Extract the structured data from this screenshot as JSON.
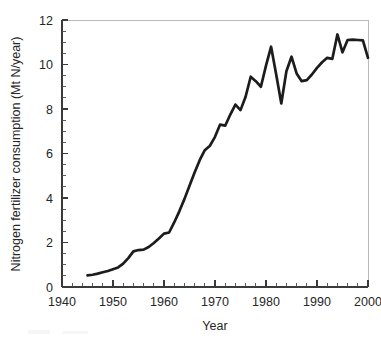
{
  "figure": {
    "background_color": "#ffffff",
    "line_color": "#1c1c1c",
    "axis_color": "#3a3a3a",
    "frame_color": "#b9b9b9"
  },
  "chart_data": {
    "type": "line",
    "title": "",
    "subtitle": "",
    "xlabel": "Year",
    "ylabel": "Nitrogen fertilizer consumption (Mt N/year)",
    "xlim": [
      1940,
      2000
    ],
    "ylim": [
      0,
      12
    ],
    "xticks": [
      1940,
      1950,
      1960,
      1970,
      1980,
      1990,
      2000
    ],
    "xtick_labels": [
      "1940",
      "1950",
      "1960",
      "1970",
      "1980",
      "1990",
      "2000"
    ],
    "x_minor_tick_interval": 2,
    "yticks": [
      0,
      2,
      4,
      6,
      8,
      10,
      12
    ],
    "ytick_labels": [
      "0",
      "2",
      "4",
      "6",
      "8",
      "10",
      "12"
    ],
    "y_minor_tick_interval": 0.5,
    "grid": false,
    "legend": null,
    "legend_position": "none",
    "annotations": [],
    "series": [
      {
        "name": "Nitrogen fertilizer consumption",
        "color": "#1c1c1c",
        "x": [
          1945,
          1946,
          1947,
          1948,
          1949,
          1950,
          1951,
          1952,
          1953,
          1954,
          1955,
          1956,
          1957,
          1958,
          1959,
          1960,
          1961,
          1962,
          1963,
          1964,
          1965,
          1966,
          1967,
          1968,
          1969,
          1970,
          1971,
          1972,
          1973,
          1974,
          1975,
          1976,
          1977,
          1978,
          1979,
          1980,
          1981,
          1982,
          1983,
          1984,
          1985,
          1986,
          1987,
          1988,
          1989,
          1990,
          1991,
          1992,
          1993,
          1994,
          1995,
          1996,
          1997,
          1998,
          1999,
          2000
        ],
        "values": [
          0.52,
          0.55,
          0.6,
          0.66,
          0.72,
          0.8,
          0.88,
          1.05,
          1.3,
          1.6,
          1.66,
          1.68,
          1.8,
          1.98,
          2.18,
          2.4,
          2.45,
          2.9,
          3.4,
          3.95,
          4.55,
          5.15,
          5.7,
          6.15,
          6.35,
          6.75,
          7.3,
          7.25,
          7.75,
          8.2,
          7.95,
          8.55,
          9.45,
          9.25,
          9.0,
          9.95,
          10.8,
          9.55,
          8.25,
          9.7,
          10.35,
          9.6,
          9.25,
          9.3,
          9.55,
          9.85,
          10.1,
          10.3,
          10.25,
          11.35,
          10.55,
          11.1,
          11.12,
          11.1,
          11.08,
          10.3
        ]
      }
    ]
  }
}
